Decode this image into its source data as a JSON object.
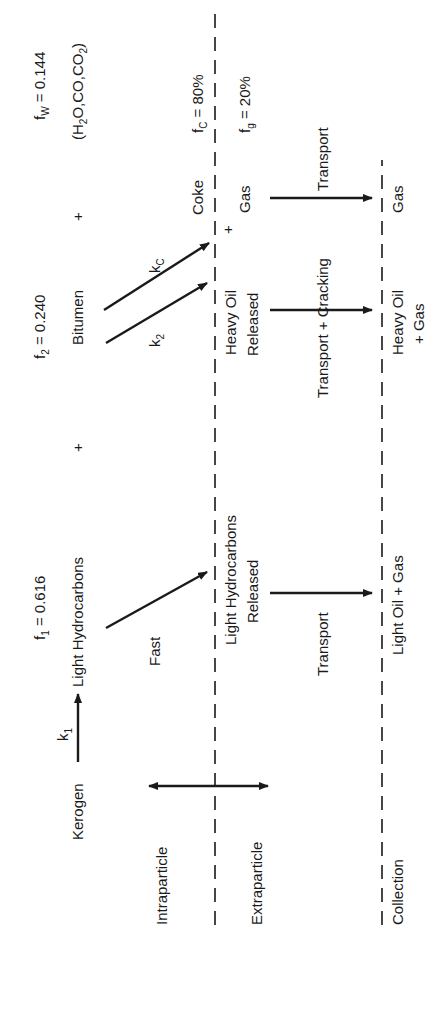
{
  "figure": {
    "type": "reaction-pathway-diagram",
    "orientation": "rotated-90-ccw",
    "zones": [
      {
        "label": "Intraparticle"
      },
      {
        "label": "Extraparticle"
      },
      {
        "label": "Collection"
      }
    ],
    "fractions": {
      "f1": {
        "symbol": "f",
        "sub": "1",
        "value": " = 0.616"
      },
      "f2": {
        "symbol": "f",
        "sub": "2",
        "value": " = 0.240"
      },
      "fw": {
        "symbol": "f",
        "sub": "W",
        "value": " = 0.144"
      },
      "fw_species": {
        "open": "(H",
        "sub1": "2",
        "mid": "O,CO,CO",
        "sub2": "2",
        "close": ")"
      },
      "fc": {
        "symbol": "f",
        "sub": "C",
        "value": " = 80%"
      },
      "fg": {
        "symbol": "f",
        "sub": "g",
        "value": " = 20%"
      }
    },
    "species": {
      "kerogen": "Kerogen",
      "light_hc": "Light Hydrocarbons",
      "plus1": "+",
      "bitumen": "Bitumen",
      "plus2": "+"
    },
    "rates": {
      "k1": {
        "symbol": "k",
        "sub": "1"
      },
      "k2": {
        "symbol": "k",
        "sub": "2"
      },
      "kc": {
        "symbol": "k",
        "sub": "C"
      },
      "fast": "Fast"
    },
    "released": {
      "light_line1": "Light Hydrocarbons",
      "light_line2": "Released",
      "heavy_line1": "Heavy Oil",
      "heavy_line2": "Released",
      "coke": "Coke",
      "plus": "+",
      "gas": "Gas"
    },
    "transport": {
      "light": "Transport",
      "heavy": "Transport  + Cracking",
      "gas": "Transport"
    },
    "products": {
      "light": "Light Oil + Gas",
      "heavy_line1": "Heavy Oil",
      "heavy_line2": "+ Gas",
      "gas": "Gas"
    }
  }
}
